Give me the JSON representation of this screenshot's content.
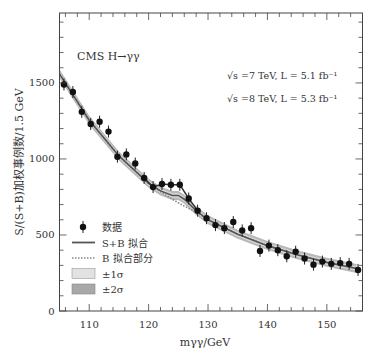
{
  "chart_data": {
    "type": "scatter",
    "title": "CMS H→γγ",
    "annotations": [
      "√s =7 TeV, L = 5.1 fb⁻¹",
      "√s =8 TeV, L = 5.3 fb⁻¹"
    ],
    "xlabel": "mγγ/GeV",
    "ylabel": "S/(S+B)加权事例数/1.5 GeV",
    "xlim": [
      105,
      156
    ],
    "ylim": [
      0,
      1960
    ],
    "x_ticks": [
      110,
      120,
      130,
      140,
      150
    ],
    "y_ticks": [
      0,
      500,
      1000,
      1500
    ],
    "grid": false,
    "legend_position": "lower left",
    "legend": [
      {
        "label": "数据",
        "style": "point-errorbar"
      },
      {
        "label": "S+B 拟合",
        "style": "solid-line"
      },
      {
        "label": "B 拟合部分",
        "style": "dotted-line"
      },
      {
        "label": "±1σ",
        "style": "band-light"
      },
      {
        "label": "±2σ",
        "style": "band-dark"
      }
    ],
    "series": [
      {
        "name": "数据",
        "x": [
          105.75,
          107.25,
          108.75,
          110.25,
          111.75,
          113.25,
          114.75,
          116.25,
          117.75,
          119.25,
          120.75,
          122.25,
          123.75,
          125.25,
          126.75,
          128.25,
          129.75,
          131.25,
          132.75,
          134.25,
          135.75,
          137.25,
          138.75,
          140.25,
          141.75,
          143.25,
          144.75,
          146.25,
          147.75,
          149.25,
          150.75,
          152.25,
          153.75,
          155.25
        ],
        "y": [
          1490,
          1440,
          1310,
          1230,
          1245,
          1180,
          1015,
          1030,
          970,
          875,
          815,
          835,
          830,
          830,
          740,
          660,
          610,
          565,
          545,
          585,
          530,
          545,
          395,
          430,
          400,
          360,
          390,
          345,
          305,
          325,
          310,
          315,
          310,
          270
        ]
      },
      {
        "name": "S+B 拟合",
        "x": [
          105,
          110,
          115,
          120,
          122,
          124,
          125,
          126,
          128,
          130,
          135,
          140,
          145,
          150,
          155
        ],
        "y": [
          1560,
          1255,
          1020,
          840,
          790,
          760,
          760,
          735,
          660,
          600,
          505,
          430,
          370,
          320,
          280
        ]
      },
      {
        "name": "B 拟合部分",
        "x": [
          105,
          110,
          115,
          120,
          122,
          124,
          125,
          126,
          128,
          130,
          135,
          140,
          145,
          150,
          155
        ],
        "y": [
          1560,
          1255,
          1020,
          840,
          785,
          735,
          712,
          690,
          650,
          600,
          505,
          430,
          370,
          320,
          280
        ]
      }
    ]
  }
}
